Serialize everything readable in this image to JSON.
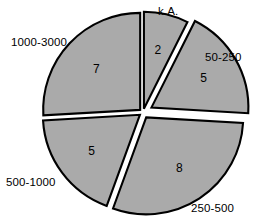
{
  "chart_data": {
    "type": "pie",
    "title": "",
    "subtitle": "",
    "xlabel": "",
    "ylabel": "",
    "legend_position": "none",
    "grid": false,
    "total": 27,
    "exploded": true,
    "fill_color": "#aaaaaa",
    "edge_color": "#000000",
    "background_color": "#ffffff",
    "labels": [
      "k.A.",
      "50-250",
      "250-500",
      "500-1000",
      "1000-3000"
    ],
    "values": [
      2,
      5,
      8,
      5,
      7
    ],
    "slices": [
      {
        "label": "k.A.",
        "value": 2,
        "value_text": "2",
        "start_angle_deg": 0,
        "end_angle_deg": 26.7,
        "explode": 0.04,
        "fill": "#aaaaaa"
      },
      {
        "label": "50-250",
        "value": 5,
        "value_text": "5",
        "start_angle_deg": 26.7,
        "end_angle_deg": 93.3,
        "explode": 0.1,
        "fill": "#aaaaaa"
      },
      {
        "label": "250-500",
        "value": 8,
        "value_text": "8",
        "start_angle_deg": 93.3,
        "end_angle_deg": 200.0,
        "explode": 0.06,
        "fill": "#aaaaaa"
      },
      {
        "label": "500-1000",
        "value": 5,
        "value_text": "5",
        "start_angle_deg": 200.0,
        "end_angle_deg": 266.7,
        "explode": 0.04,
        "fill": "#aaaaaa"
      },
      {
        "label": "1000-3000",
        "value": 7,
        "value_text": "7",
        "start_angle_deg": 266.7,
        "end_angle_deg": 360.0,
        "explode": 0.04,
        "fill": "#aaaaaa"
      }
    ]
  }
}
